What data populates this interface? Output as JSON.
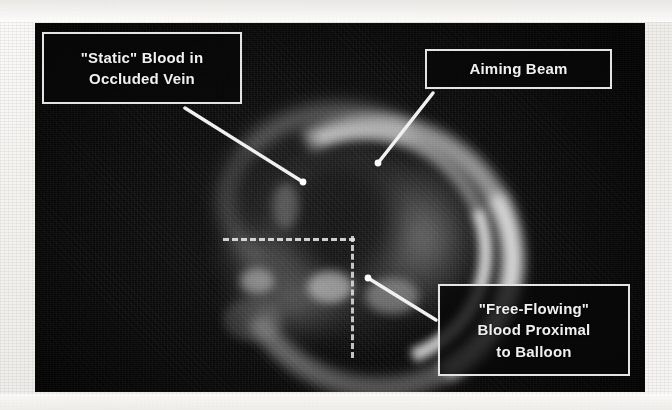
{
  "figure": {
    "kind": "annotated-photograph",
    "photo_background_color": "#0a0a0a",
    "page_background_color": "#f2f1ef",
    "annotation_text_color": "#f0f0f0",
    "annotation_border_color": "#e4e4e4",
    "leader_line_color": "#f0f0f0",
    "guide_line_color": "#e6e6e6"
  },
  "callouts": [
    {
      "id": "static-blood",
      "name": "callout-static-blood",
      "lines": [
        "\"Static\" Blood in",
        "Occluded Vein"
      ],
      "leader": {
        "from_x": 185,
        "from_y": 108,
        "to_x": 303,
        "to_y": 182
      }
    },
    {
      "id": "aiming-beam",
      "name": "callout-aiming-beam",
      "lines": [
        "Aiming Beam"
      ],
      "leader": {
        "from_x": 433,
        "from_y": 93,
        "to_x": 378,
        "to_y": 163
      }
    },
    {
      "id": "free-flowing-blood",
      "name": "callout-free-flowing-blood",
      "lines": [
        "\"Free-Flowing\"",
        "Blood Proximal",
        "to Balloon"
      ],
      "leader": {
        "from_x": 436,
        "from_y": 320,
        "to_x": 368,
        "to_y": 278
      }
    }
  ],
  "guides": {
    "horizontal_dashed": {
      "x1": 188,
      "y": 215,
      "x2": 320
    },
    "vertical_dashed": {
      "x": 316,
      "y1": 213,
      "y2": 335
    }
  }
}
